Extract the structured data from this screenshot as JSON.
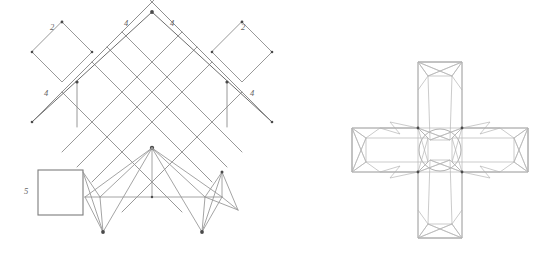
{
  "figure": {
    "background_color": "#ffffff",
    "line_color": "#8c8c8c",
    "node_color": "#4a4a4a",
    "label_color": "#666666"
  },
  "left_diagram": {
    "name": "rotated-diamond-lattice-with-truss",
    "description": "Rotated square lattice of diamonds over a lower truss structure with an attached square block",
    "dimension_labels": [
      {
        "id": "label-top-left-2",
        "text": "2",
        "x": 52,
        "y": 30
      },
      {
        "id": "label-top-mid-left-4",
        "text": "4",
        "x": 126,
        "y": 26
      },
      {
        "id": "label-top-mid-right-4",
        "text": "4",
        "x": 172,
        "y": 26
      },
      {
        "id": "label-top-right-2",
        "text": "2",
        "x": 243,
        "y": 30
      },
      {
        "id": "label-left-4",
        "text": "4",
        "x": 46,
        "y": 96
      },
      {
        "id": "label-right-4",
        "text": "4",
        "x": 252,
        "y": 96
      },
      {
        "id": "label-square-5",
        "text": "5",
        "x": 26,
        "y": 194
      }
    ],
    "lattice": {
      "apex": [
        152,
        12
      ],
      "left_vertex": [
        32,
        122
      ],
      "right_vertex": [
        272,
        122
      ],
      "cell_count": 12
    },
    "square_block": {
      "x": 38,
      "y": 170,
      "width": 45,
      "height": 45
    },
    "truss_nodes": [
      [
        152,
        148
      ],
      [
        102,
        197
      ],
      [
        152,
        197
      ],
      [
        202,
        197
      ],
      [
        102,
        232
      ],
      [
        202,
        232
      ],
      [
        222,
        172
      ],
      [
        238,
        210
      ]
    ]
  },
  "right_diagram": {
    "name": "cross-shaped-mesh",
    "description": "Plus/cross shaped mesh with hourglass shaded corner elements at each arm end and around the central opening",
    "center": [
      440,
      150
    ],
    "arm_length": 88,
    "arm_half_width": 22,
    "arm_count": 4,
    "hourglass_elements": 12
  }
}
